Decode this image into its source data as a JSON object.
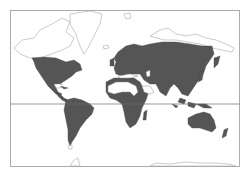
{
  "map": {
    "type": "world distribution map",
    "projection": "Mercator",
    "colors": {
      "shaded": "#555555",
      "unshaded_land": "#ffffff",
      "outline": "#a8a8a8",
      "equator": "#6a6a6a"
    },
    "layers": {
      "equator_line": true,
      "frame": true
    },
    "shaded_regions": [
      "North America",
      "Central America",
      "South America",
      "Europe",
      "Africa (excluding Sahara)",
      "Asia",
      "Maritime Southeast Asia",
      "Australia",
      "New Zealand"
    ],
    "unshaded_regions": [
      "Greenland",
      "Arctic Canada",
      "Sahara",
      "Arabian Peninsula",
      "Siberian Arctic coast",
      "Antarctica"
    ]
  }
}
